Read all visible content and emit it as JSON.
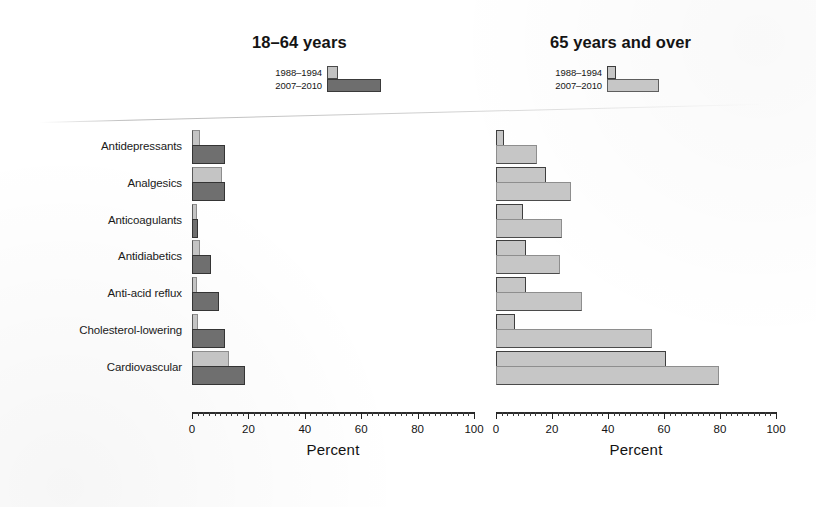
{
  "panels": [
    {
      "key": "left",
      "title": "18–64 years",
      "legend": [
        {
          "label": "1988–1994",
          "swatch": "old-period-swatch"
        },
        {
          "label": "2007–2010",
          "swatch": "new-period-swatch"
        }
      ],
      "axis_title": "Percent",
      "tick_labels": [
        "0",
        "20",
        "40",
        "60",
        "80",
        "100"
      ]
    },
    {
      "key": "right",
      "title": "65 years and over",
      "legend": [
        {
          "label": "1988–1994",
          "swatch": "old-period-swatch"
        },
        {
          "label": "2007–2010",
          "swatch": "new-period-swatch"
        }
      ],
      "axis_title": "Percent",
      "tick_labels": [
        "0",
        "20",
        "40",
        "60",
        "80",
        "100"
      ]
    }
  ],
  "categories": [
    "Antidepressants",
    "Analgesics",
    "Anticoagulants",
    "Antidiabetics",
    "Anti-acid reflux",
    "Cholesterol-lowering",
    "Cardiovascular"
  ],
  "colors": {
    "old_period_fill": "#c4c4c4",
    "new_period_fill_left": "#6f6f6f",
    "new_period_fill_right": "#c6c6c6",
    "outline": "#3a3a3a",
    "axis": "#2b2b2b",
    "text": "#141414",
    "background": "#ffffff"
  },
  "chart_data": [
    {
      "type": "bar",
      "title": "18–64 years",
      "orientation": "horizontal",
      "xlabel": "Percent",
      "ylabel": "",
      "xlim": [
        0,
        100
      ],
      "xticks": [
        0,
        20,
        40,
        60,
        80,
        100
      ],
      "minor_tick_interval": 2,
      "grid": false,
      "legend_position": "top",
      "categories": [
        "Antidepressants",
        "Analgesics",
        "Anticoagulants",
        "Antidiabetics",
        "Anti-acid reflux",
        "Cholesterol-lowering",
        "Cardiovascular"
      ],
      "series": [
        {
          "name": "1988–1994",
          "values": [
            2,
            10,
            1,
            2,
            1,
            1.5,
            12.5
          ]
        },
        {
          "name": "2007–2010",
          "values": [
            11,
            11,
            1.5,
            6,
            9,
            11,
            18
          ]
        }
      ]
    },
    {
      "type": "bar",
      "title": "65 years and over",
      "orientation": "horizontal",
      "xlabel": "Percent",
      "ylabel": "",
      "xlim": [
        0,
        100
      ],
      "xticks": [
        0,
        20,
        40,
        60,
        80,
        100
      ],
      "minor_tick_interval": 2,
      "grid": false,
      "legend_position": "top",
      "categories": [
        "Antidepressants",
        "Analgesics",
        "Anticoagulants",
        "Antidiabetics",
        "Anti-acid reflux",
        "Cholesterol-lowering",
        "Cardiovascular"
      ],
      "series": [
        {
          "name": "1988–1994",
          "values": [
            2,
            17,
            9,
            10,
            10,
            6,
            60
          ]
        },
        {
          "name": "2007–2010",
          "values": [
            14,
            26,
            23,
            22,
            30,
            55,
            79
          ]
        }
      ]
    }
  ]
}
